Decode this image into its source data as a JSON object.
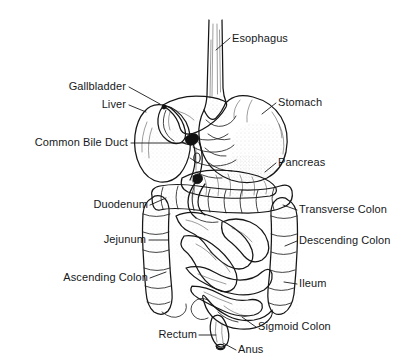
{
  "figure": {
    "background_color": "#ffffff",
    "ink_color": "#151515",
    "label_color": "#16181a",
    "width": 404,
    "height": 364
  },
  "labels": [
    {
      "id": "esophagus",
      "text": "Esophagus",
      "align": "start",
      "text_x": 232,
      "text_y": 42,
      "leader": "M 230 38 L 216 50"
    },
    {
      "id": "gallbladder",
      "text": "Gallbladder",
      "align": "end",
      "text_x": 126,
      "text_y": 90,
      "leader": "M 129 87 L 160 104"
    },
    {
      "id": "liver",
      "text": "Liver",
      "align": "end",
      "text_x": 126,
      "text_y": 108,
      "leader": "M 129 105 L 146 112"
    },
    {
      "id": "stomach",
      "text": "Stomach",
      "align": "start",
      "text_x": 278,
      "text_y": 106,
      "leader": "M 276 103 L 262 114"
    },
    {
      "id": "common-bile-duct",
      "text": "Common Bile Duct",
      "align": "end",
      "text_x": 128,
      "text_y": 146,
      "leader": "M 131 143 L 186 143"
    },
    {
      "id": "pancreas",
      "text": "Pancreas",
      "align": "start",
      "text_x": 278,
      "text_y": 166,
      "leader": "M 276 163 L 265 172"
    },
    {
      "id": "duodenum",
      "text": "Duodenum",
      "align": "end",
      "text_x": 148,
      "text_y": 208,
      "leader": "M 150 205 L 166 198"
    },
    {
      "id": "transverse-colon",
      "text": "Transverse Colon",
      "align": "start",
      "text_x": 299,
      "text_y": 213,
      "leader": "M 297 210 L 283 205"
    },
    {
      "id": "jejunum",
      "text": "Jejunum",
      "align": "end",
      "text_x": 146,
      "text_y": 243,
      "leader": "M 149 240 L 168 240"
    },
    {
      "id": "descending-colon",
      "text": "Descending Colon",
      "align": "start",
      "text_x": 299,
      "text_y": 244,
      "leader": "M 297 241 L 285 246"
    },
    {
      "id": "ascending-colon",
      "text": "Ascending Colon",
      "align": "end",
      "text_x": 148,
      "text_y": 281,
      "leader": "M 150 278 L 166 272"
    },
    {
      "id": "ileum",
      "text": "Ileum",
      "align": "start",
      "text_x": 299,
      "text_y": 287,
      "leader": "M 297 284 L 284 282"
    },
    {
      "id": "sigmoid-colon",
      "text": "Sigmoid Colon",
      "align": "start",
      "text_x": 258,
      "text_y": 330,
      "leader": "M 256 327 L 242 317"
    },
    {
      "id": "rectum",
      "text": "Rectum",
      "align": "end",
      "text_x": 197,
      "text_y": 338,
      "leader": "M 199 335 L 216 335"
    },
    {
      "id": "anus",
      "text": "Anus",
      "align": "start",
      "text_x": 238,
      "text_y": 353,
      "leader": "M 236 350 L 223 343"
    }
  ],
  "organs": [
    {
      "id": "esophagus",
      "name": "Esophagus"
    },
    {
      "id": "stomach",
      "name": "Stomach"
    },
    {
      "id": "liver",
      "name": "Liver"
    },
    {
      "id": "gallbladder",
      "name": "Gallbladder"
    },
    {
      "id": "common-bile-duct",
      "name": "Common Bile Duct"
    },
    {
      "id": "pancreas",
      "name": "Pancreas"
    },
    {
      "id": "duodenum",
      "name": "Duodenum"
    },
    {
      "id": "jejunum",
      "name": "Jejunum"
    },
    {
      "id": "ileum",
      "name": "Ileum"
    },
    {
      "id": "ascending-colon",
      "name": "Ascending Colon"
    },
    {
      "id": "transverse-colon",
      "name": "Transverse Colon"
    },
    {
      "id": "descending-colon",
      "name": "Descending Colon"
    },
    {
      "id": "sigmoid-colon",
      "name": "Sigmoid Colon"
    },
    {
      "id": "rectum",
      "name": "Rectum"
    },
    {
      "id": "anus",
      "name": "Anus"
    }
  ]
}
